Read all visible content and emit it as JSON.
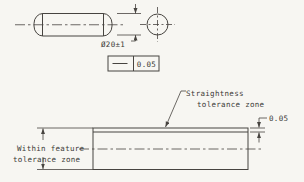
{
  "colors": {
    "background": "#f7f6f2",
    "line": "#474440",
    "text": "#3b3936"
  },
  "side_view": {
    "diameter_label": "Ø20±1"
  },
  "feature_control_frame": {
    "symbol": "straightness",
    "tolerance": "0.05"
  },
  "zone_view": {
    "callout_line1": "Straightness",
    "callout_line2": "tolerance zone",
    "zone_height_label": "0.05",
    "within_label_line1": "Within feature",
    "within_label_line2": "tolerance zone"
  }
}
